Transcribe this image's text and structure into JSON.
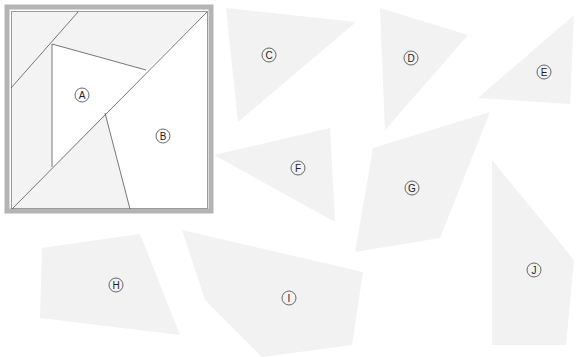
{
  "puzzle": {
    "type": "dissection-puzzle",
    "square": {
      "frame": {
        "x": 5,
        "y": 5,
        "size": 208,
        "color": "#b4b4b4"
      },
      "inner": {
        "x": 11,
        "y": 11,
        "size": 197
      },
      "labels": [
        {
          "id": "A",
          "glyph": "Ⓐ",
          "x": 82,
          "y": 95
        },
        {
          "id": "B",
          "glyph": "Ⓑ",
          "x": 163,
          "y": 136
        }
      ]
    },
    "pieces": [
      {
        "id": "C",
        "glyph": "Ⓒ",
        "label_x": 269,
        "label_y": 55,
        "points": "226,8 356,22 238,122"
      },
      {
        "id": "D",
        "glyph": "Ⓓ",
        "label_x": 411,
        "label_y": 58,
        "points": "380,8 468,35 385,130"
      },
      {
        "id": "E",
        "glyph": "Ⓔ",
        "label_x": 544,
        "label_y": 72,
        "points": "478,98 574,15 570,104"
      },
      {
        "id": "F",
        "glyph": "Ⓕ",
        "label_x": 298,
        "label_y": 168,
        "points": "214,155 330,128 335,222"
      },
      {
        "id": "G",
        "glyph": "Ⓖ",
        "label_x": 412,
        "label_y": 188,
        "points": "373,148 490,112 440,238 355,252"
      },
      {
        "id": "H",
        "glyph": "Ⓗ",
        "label_x": 116,
        "label_y": 285,
        "points": "42,248 140,234 180,335 40,318"
      },
      {
        "id": "I",
        "glyph": "Ⓘ",
        "label_x": 289,
        "label_y": 298,
        "points": "182,230 363,272 352,345 262,357 205,300"
      },
      {
        "id": "J",
        "glyph": "Ⓙ",
        "label_x": 534,
        "label_y": 270,
        "points": "492,160 574,260 566,345 492,345"
      }
    ],
    "colors": {
      "piece_fill": "#f2f2f2",
      "line": "#555555",
      "label": "#222222"
    }
  }
}
